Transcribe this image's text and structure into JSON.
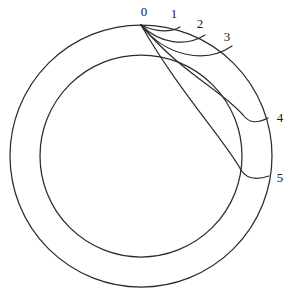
{
  "figure": {
    "background_color": "#ffffff",
    "stroke_color": "#2b2b2b",
    "label_color": "#1a1a1a",
    "width": 295,
    "height": 304
  },
  "geometry": {
    "center": {
      "x": 141,
      "y": 156
    },
    "outer_radius": 131,
    "inner_radius": 101,
    "base_point": {
      "x": 141,
      "y": 25
    }
  },
  "labels": [
    {
      "text": "0",
      "x": 144,
      "y": 13
    },
    {
      "text": "1",
      "x": 174,
      "y": 15
    },
    {
      "text": "2",
      "x": 200,
      "y": 25
    },
    {
      "text": "3",
      "x": 227,
      "y": 38
    },
    {
      "text": "4",
      "x": 280,
      "y": 119
    },
    {
      "text": "5",
      "x": 280,
      "y": 179
    }
  ],
  "arcs": [
    {
      "name": "arc-1",
      "endpoint_label": "1",
      "path": "M 141 25 C 157 33, 172 32, 180 27"
    },
    {
      "name": "arc-2",
      "endpoint_label": "2",
      "path": "M 141 25 C 160 44, 186 47, 205 35"
    },
    {
      "name": "arc-3",
      "endpoint_label": "3",
      "path": "M 141 25 C 166 57, 206 64, 232 46"
    },
    {
      "name": "arc-4",
      "endpoint_label": "4",
      "path": "M 141 25 C 180 72, 224 92, 243 115 C 250 124, 258 123, 268 118"
    },
    {
      "name": "arc-5",
      "endpoint_label": "5",
      "path": "M 141 25 C 178 90, 226 142, 241 170 C 247 180, 257 180, 269 176"
    }
  ],
  "inner_tangent_segments": [
    {
      "name": "inner-chord-4",
      "path": "M 141 25 C 180 72, 224 92, 243 115"
    },
    {
      "name": "inner-chord-5",
      "path": "M 141 25 C 178 90, 226 142, 241 170"
    }
  ]
}
